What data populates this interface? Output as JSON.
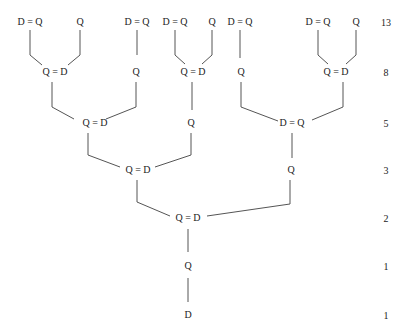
{
  "diagram": {
    "type": "binary-tree",
    "levels": [
      {
        "count": "13",
        "y": 22,
        "nodes": [
          {
            "label": "D = Q",
            "x": 30
          },
          {
            "label": "Q",
            "x": 80
          },
          {
            "label": "D = Q",
            "x": 137
          },
          {
            "label": "D = Q",
            "x": 175
          },
          {
            "label": "Q",
            "x": 212
          },
          {
            "label": "D = Q",
            "x": 240
          },
          {
            "label": "D = Q",
            "x": 318
          },
          {
            "label": "Q",
            "x": 356
          }
        ]
      },
      {
        "count": "8",
        "y": 72,
        "nodes": [
          {
            "label": "Q = D",
            "x": 55
          },
          {
            "label": "Q",
            "x": 136
          },
          {
            "label": "Q = D",
            "x": 193
          },
          {
            "label": "Q",
            "x": 241
          },
          {
            "label": "Q = D",
            "x": 336
          }
        ]
      },
      {
        "count": "5",
        "y": 123,
        "nodes": [
          {
            "label": "Q = D",
            "x": 95
          },
          {
            "label": "Q",
            "x": 191
          },
          {
            "label": "D = Q",
            "x": 292
          }
        ]
      },
      {
        "count": "3",
        "y": 170,
        "nodes": [
          {
            "label": "Q = D",
            "x": 138
          },
          {
            "label": "Q",
            "x": 291
          }
        ]
      },
      {
        "count": "2",
        "y": 218,
        "nodes": [
          {
            "label": "Q = D",
            "x": 188
          }
        ]
      },
      {
        "count": "1",
        "y": 266,
        "nodes": [
          {
            "label": "Q",
            "x": 188
          }
        ]
      },
      {
        "count": "1",
        "y": 315,
        "nodes": [
          {
            "label": "D",
            "x": 188
          }
        ]
      }
    ],
    "count_x": 386,
    "line_color": "#555555"
  }
}
